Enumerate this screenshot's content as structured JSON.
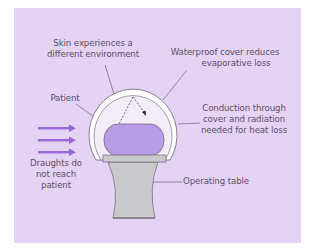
{
  "diagram": {
    "labels": {
      "skin": [
        "Skin experiences a",
        "different environment"
      ],
      "waterproof": [
        "Waterproof cover reduces",
        "evaporative loss"
      ],
      "patient": "Patient",
      "conduction": [
        "Conduction through",
        "cover and radiation",
        "needed for heat loss"
      ],
      "draughts": [
        "Draughts do",
        "not reach",
        "patient"
      ],
      "table": "Operating table"
    },
    "colors": {
      "panel": "#E5D3F6",
      "patient": "#B99CE8",
      "arrows": "#9B66D6",
      "table": "#C9C9CB",
      "cover": "#FFFFFF",
      "inner_cover": "#F1EAF7",
      "lines": "#6a6070"
    }
  }
}
